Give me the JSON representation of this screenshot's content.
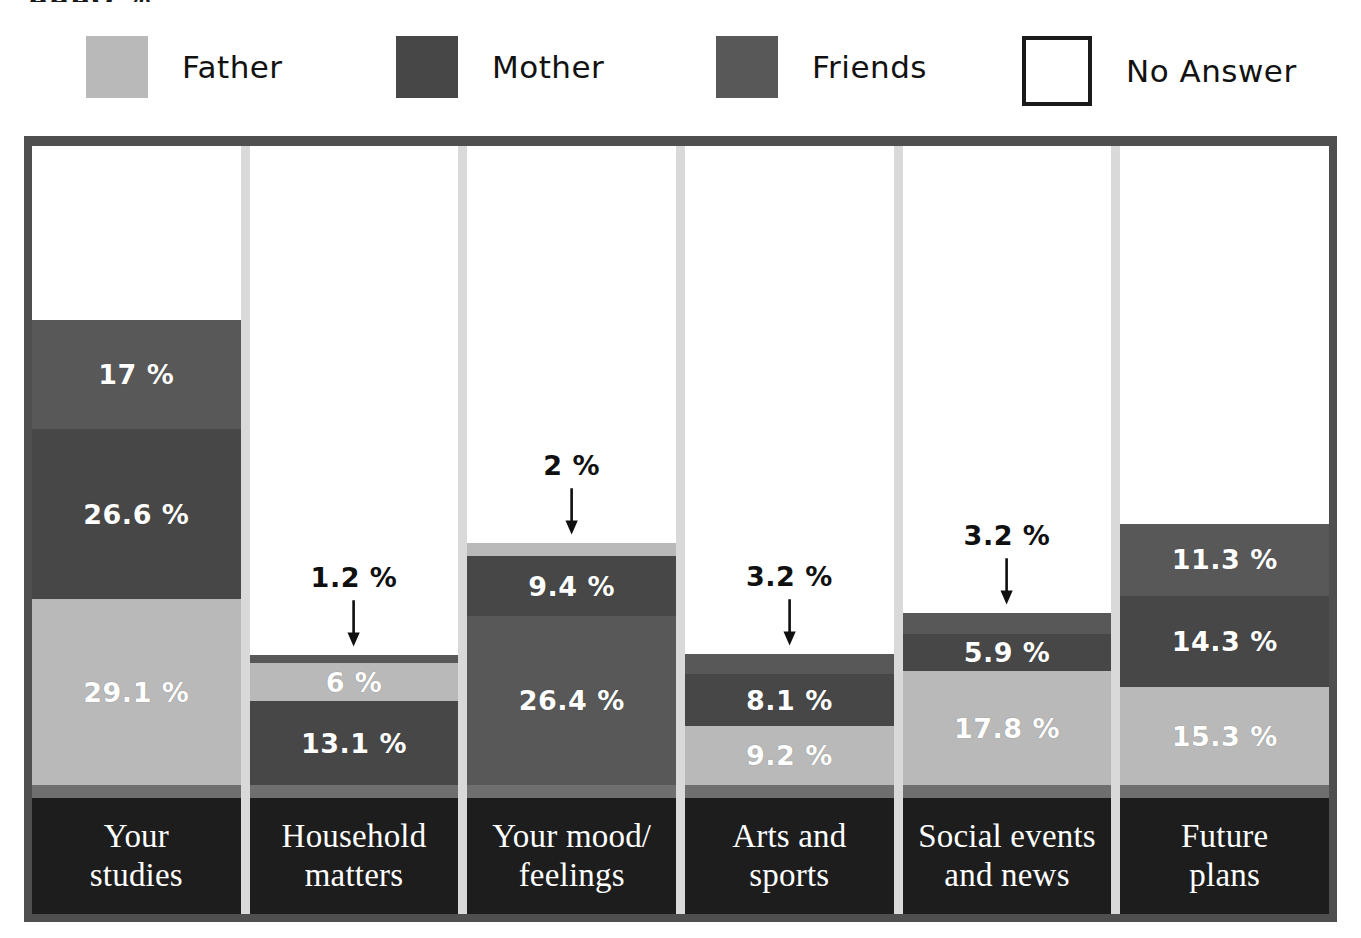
{
  "title_fragment": "AAAO  %",
  "legend": {
    "items": [
      {
        "label": "Father",
        "color": "#b9b9b9",
        "swatch": "filled"
      },
      {
        "label": "Mother",
        "color": "#474747",
        "swatch": "filled"
      },
      {
        "label": "Friends",
        "color": "#585858",
        "swatch": "filled"
      },
      {
        "label": "No Answer",
        "color": "#ffffff",
        "swatch": "outline"
      }
    ]
  },
  "colors": {
    "father": "#b9b9b9",
    "mother": "#474747",
    "friends": "#585858",
    "no_answer": "#ffffff",
    "frame": "#4f4f4f",
    "gap": "#d9d9d9",
    "base_strip": "#6f6f6f",
    "category_band": "#1d1d1d",
    "text_on_bar": "#ffffff",
    "callout_text": "#101010"
  },
  "chart_data": {
    "type": "bar",
    "subtype": "stacked-column",
    "title": "",
    "xlabel": "",
    "ylabel": "",
    "ylim": [
      0,
      100
    ],
    "unit": "%",
    "grid": false,
    "legend_position": "top",
    "series_names": [
      "Father",
      "Mother",
      "Friends",
      "No Answer"
    ],
    "categories": [
      "Your studies",
      "Household matters",
      "Your mood/ feelings",
      "Arts and sports",
      "Social events and news",
      "Future plans"
    ],
    "series": [
      {
        "name": "Father",
        "values": [
          29.1,
          6.0,
          2.0,
          9.2,
          17.8,
          15.3
        ]
      },
      {
        "name": "Mother",
        "values": [
          26.6,
          13.1,
          9.4,
          8.1,
          5.9,
          14.3
        ]
      },
      {
        "name": "Friends",
        "values": [
          17.0,
          1.2,
          26.4,
          3.2,
          3.2,
          11.3
        ]
      },
      {
        "name": "No Answer",
        "values": [
          27.3,
          79.7,
          62.2,
          79.5,
          73.1,
          59.1
        ]
      }
    ],
    "columns": [
      {
        "category": "Your studies",
        "category_lines": [
          "Your",
          "studies"
        ],
        "total_stacked": 72.7,
        "segments": [
          {
            "series": "Father",
            "value": 29.1,
            "label": "29.1 %",
            "label_placement": "inside"
          },
          {
            "series": "Mother",
            "value": 26.6,
            "label": "26.6 %",
            "label_placement": "inside"
          },
          {
            "series": "Friends",
            "value": 17.0,
            "label": "17 %",
            "label_placement": "inside"
          }
        ]
      },
      {
        "category": "Household matters",
        "category_lines": [
          "Household",
          "matters"
        ],
        "total_stacked": 20.3,
        "segments": [
          {
            "series": "Mother",
            "value": 13.1,
            "label": "13.1 %",
            "label_placement": "inside"
          },
          {
            "series": "Father",
            "value": 6.0,
            "label": "6 %",
            "label_placement": "inside"
          },
          {
            "series": "Friends",
            "value": 1.2,
            "label": "1.2 %",
            "label_placement": "callout"
          }
        ]
      },
      {
        "category": "Your mood/ feelings",
        "category_lines": [
          "Your mood/",
          "feelings"
        ],
        "total_stacked": 37.8,
        "segments": [
          {
            "series": "Friends",
            "value": 26.4,
            "label": "26.4 %",
            "label_placement": "inside"
          },
          {
            "series": "Mother",
            "value": 9.4,
            "label": "9.4 %",
            "label_placement": "inside"
          },
          {
            "series": "Father",
            "value": 2.0,
            "label": "2 %",
            "label_placement": "callout"
          }
        ]
      },
      {
        "category": "Arts and sports",
        "category_lines": [
          "Arts and",
          "sports"
        ],
        "total_stacked": 20.5,
        "segments": [
          {
            "series": "Father",
            "value": 9.2,
            "label": "9.2 %",
            "label_placement": "inside"
          },
          {
            "series": "Mother",
            "value": 8.1,
            "label": "8.1 %",
            "label_placement": "inside"
          },
          {
            "series": "Friends",
            "value": 3.2,
            "label": "3.2 %",
            "label_placement": "callout"
          }
        ]
      },
      {
        "category": "Social events and news",
        "category_lines": [
          "Social events",
          "and news"
        ],
        "total_stacked": 26.9,
        "segments": [
          {
            "series": "Father",
            "value": 17.8,
            "label": "17.8 %",
            "label_placement": "inside"
          },
          {
            "series": "Mother",
            "value": 5.9,
            "label": "5.9 %",
            "label_placement": "inside"
          },
          {
            "series": "Friends",
            "value": 3.2,
            "label": "3.2 %",
            "label_placement": "callout"
          }
        ]
      },
      {
        "category": "Future plans",
        "category_lines": [
          "Future",
          "plans"
        ],
        "total_stacked": 40.9,
        "segments": [
          {
            "series": "Father",
            "value": 15.3,
            "label": "15.3 %",
            "label_placement": "inside"
          },
          {
            "series": "Mother",
            "value": 14.3,
            "label": "14.3 %",
            "label_placement": "inside"
          },
          {
            "series": "Friends",
            "value": 11.3,
            "label": "11.3 %",
            "label_placement": "inside"
          }
        ]
      }
    ]
  }
}
